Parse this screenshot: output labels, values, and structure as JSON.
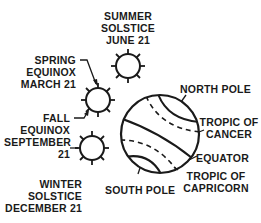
{
  "diagram": {
    "colors": {
      "ink": "#1a1a1a",
      "background": "#ffffff"
    },
    "suns": [
      {
        "id": "summer",
        "lines": [
          "SUMMER",
          "SOLSTICE",
          "JUNE 21"
        ]
      },
      {
        "id": "spring",
        "lines": [
          "SPRING",
          "EQUINOX",
          "MARCH 21"
        ]
      },
      {
        "id": "fall",
        "lines": [
          "FALL",
          "EQUINOX",
          "SEPTEMBER",
          "21"
        ]
      },
      {
        "id": "winter",
        "lines": [
          "WINTER",
          "SOLSTICE",
          "DECEMBER 21"
        ]
      }
    ],
    "globe": {
      "north_pole": "NORTH POLE",
      "tropic_of_cancer": [
        "TROPIC OF",
        "CANCER"
      ],
      "equator": "EQUATOR",
      "tropic_of_capricorn": [
        "TROPIC OF",
        "CAPRICORN"
      ],
      "south_pole": "SOUTH POLE"
    }
  }
}
